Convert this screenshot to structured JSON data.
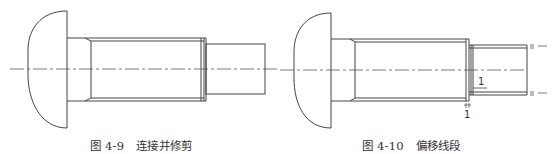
{
  "figures": [
    {
      "id": "fig-4-9",
      "caption_number": "图 4-9",
      "caption_title": "连接并修剪",
      "stroke_color": "#444444"
    },
    {
      "id": "fig-4-10",
      "caption_number": "图 4-10",
      "caption_title": "偏移线段",
      "stroke_color": "#444444",
      "offset_labels": [
        "1",
        "1"
      ]
    }
  ]
}
